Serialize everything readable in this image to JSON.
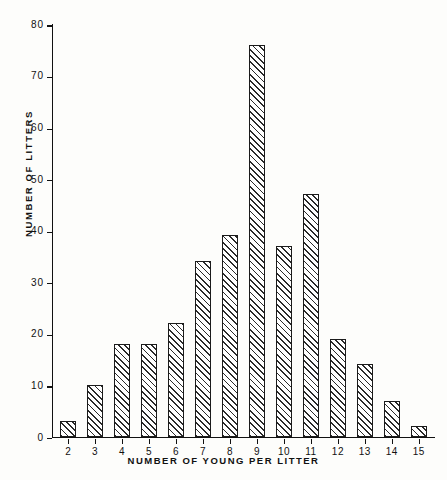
{
  "chart_data": {
    "type": "bar",
    "title": "",
    "xlabel": "NUMBER OF YOUNG PER LITTER",
    "ylabel": "NUMBER OF LITTERS",
    "categories": [
      "2",
      "3",
      "4",
      "5",
      "6",
      "7",
      "8",
      "9",
      "10",
      "11",
      "12",
      "13",
      "14",
      "15"
    ],
    "values": [
      3,
      10,
      18,
      18,
      22,
      34,
      39,
      76,
      37,
      47,
      19,
      14,
      7,
      2
    ],
    "xlim": [
      1.4,
      15.6
    ],
    "ylim": [
      0,
      80
    ],
    "ytick_labels": [
      "0",
      "10",
      "20",
      "30",
      "40",
      "50",
      "60",
      "70",
      "80"
    ],
    "ytick_values": [
      0,
      10,
      20,
      30,
      40,
      50,
      60,
      70,
      80
    ],
    "grid": false,
    "legend": null,
    "bar_style": {
      "fill": "#ffffff",
      "hatch": "diagonal-45",
      "edge_color": "#1b1b1b"
    },
    "background": "#fdfdfb"
  }
}
